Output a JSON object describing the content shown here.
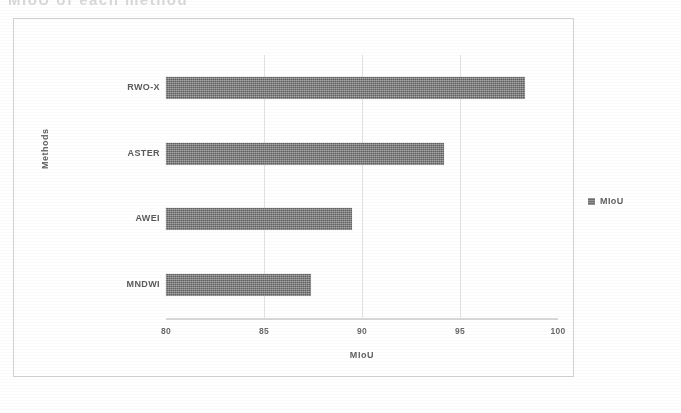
{
  "top_title": {
    "text": "MIoU of each method",
    "visible_note": "cropped faded heading at top edge"
  },
  "chart_data": {
    "type": "bar",
    "orientation": "horizontal",
    "title": "",
    "xlabel": "MIoU",
    "ylabel": "Methods",
    "categories": [
      "RWO-X",
      "ASTER",
      "AWEI",
      "MNDWI"
    ],
    "values": [
      98.3,
      94.2,
      89.5,
      87.4
    ],
    "series": [
      {
        "name": "MIoU",
        "values": [
          98.3,
          94.2,
          89.5,
          87.4
        ],
        "color": "#7a7a7a"
      }
    ],
    "xlim": [
      80,
      100
    ],
    "xticks": [
      "80",
      "85",
      "90",
      "95",
      "100"
    ],
    "xtick_values": [
      80,
      85,
      90,
      95,
      100
    ],
    "grid": "vertical gridlines at 85, 90, 95",
    "legend": {
      "position": "right",
      "entries": [
        "MIoU"
      ]
    }
  },
  "axes": {
    "x_title": "MIoU",
    "y_title": "Methods"
  },
  "legend": {
    "marker_name": "square-marker",
    "label": "MIoU"
  },
  "colors": {
    "bar": "#7a7a7a",
    "gridline": "#e2e2e2",
    "axis_line": "#d8d8d8",
    "panel_border": "#d2d2d2",
    "text": "#5f5f5f",
    "background": "#ffffff"
  }
}
